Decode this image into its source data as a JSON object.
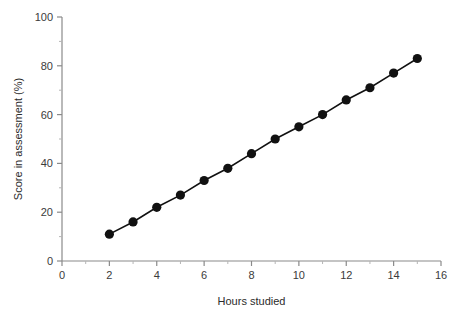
{
  "chart_data": {
    "type": "line",
    "title": "",
    "xlabel": "Hours studied",
    "ylabel": "Score in assessment (%)",
    "xlim": [
      0,
      16
    ],
    "ylim": [
      0,
      100
    ],
    "grid": false,
    "legend": "none",
    "x_ticks_major": [
      0,
      2,
      4,
      6,
      8,
      10,
      12,
      14,
      16
    ],
    "x_tick_labels": [
      "0",
      "2",
      "4",
      "6",
      "8",
      "10",
      "12",
      "14",
      "16"
    ],
    "x_ticks_minor": [
      1,
      3,
      5,
      7,
      9,
      11,
      13,
      15
    ],
    "y_ticks_major": [
      0,
      20,
      40,
      60,
      80,
      100
    ],
    "y_tick_labels": [
      "0",
      "20",
      "40",
      "60",
      "80",
      "100"
    ],
    "y_ticks_minor": [
      10,
      30,
      50,
      70,
      90
    ],
    "marker": "filled-circle",
    "marker_color": "#111111",
    "line_color": "#111111",
    "axis_color": "#8a8a8a",
    "x": [
      2,
      3,
      4,
      5,
      6,
      7,
      8,
      9,
      10,
      11,
      12,
      13,
      14,
      15
    ],
    "values": [
      11,
      16,
      22,
      27,
      33,
      38,
      44,
      50,
      55,
      60,
      66,
      71,
      77,
      83
    ],
    "series": [
      {
        "name": "Score in assessment (%)",
        "x": [
          2,
          3,
          4,
          5,
          6,
          7,
          8,
          9,
          10,
          11,
          12,
          13,
          14,
          15
        ],
        "values": [
          11,
          16,
          22,
          27,
          33,
          38,
          44,
          50,
          55,
          60,
          66,
          71,
          77,
          83
        ]
      }
    ]
  },
  "layout": {
    "plot_left": 62,
    "plot_right": 441,
    "plot_top": 17,
    "plot_bottom": 261
  }
}
